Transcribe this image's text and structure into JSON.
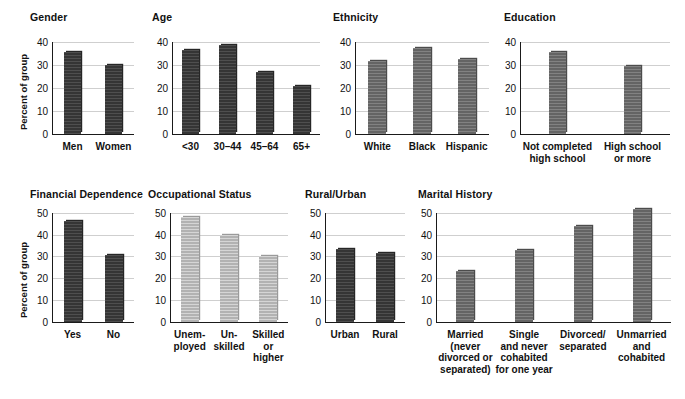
{
  "figure": {
    "y_axis_label": "Percent of group",
    "panels": [
      {
        "id": "gender",
        "title": "Gender",
        "ylim": [
          0,
          40
        ],
        "yticks": [
          0,
          10,
          20,
          30,
          40
        ],
        "shade": "dark",
        "categories": [
          "Men",
          "Women"
        ],
        "values": [
          35.7,
          29.8
        ]
      },
      {
        "id": "age",
        "title": "Age",
        "ylim": [
          0,
          40
        ],
        "yticks": [
          0,
          10,
          20,
          30,
          40
        ],
        "shade": "dark",
        "categories": [
          "<30",
          "30–44",
          "45–64",
          "65+"
        ],
        "values": [
          36.5,
          38.8,
          26.8,
          20.8
        ]
      },
      {
        "id": "ethnicity",
        "title": "Ethnicity",
        "ylim": [
          0,
          40
        ],
        "yticks": [
          0,
          10,
          20,
          30,
          40
        ],
        "shade": "mid",
        "categories": [
          "White",
          "Black",
          "Hispanic"
        ],
        "values": [
          31.5,
          37.4,
          32.5
        ]
      },
      {
        "id": "education",
        "title": "Education",
        "ylim": [
          0,
          40
        ],
        "yticks": [
          0,
          10,
          20,
          30,
          40
        ],
        "shade": "mid",
        "categories": [
          "Not completed\nhigh school",
          "High school\nor more"
        ],
        "values": [
          35.6,
          29.7
        ]
      },
      {
        "id": "financial-dependence",
        "title": "Financial Dependence",
        "ylim": [
          0,
          50
        ],
        "yticks": [
          0,
          10,
          20,
          30,
          40,
          50
        ],
        "shade": "dark",
        "categories": [
          "Yes",
          "No"
        ],
        "values": [
          46.5,
          30.5
        ]
      },
      {
        "id": "occupational-status",
        "title": "Occupational Status",
        "ylim": [
          0,
          50
        ],
        "yticks": [
          0,
          10,
          20,
          30,
          40,
          50
        ],
        "shade": "light",
        "categories": [
          "Unem-\nployed",
          "Un-\nskilled",
          "Skilled\nor\nhigher"
        ],
        "values": [
          48.0,
          39.8,
          30.0
        ]
      },
      {
        "id": "rural-urban",
        "title": "Rural/Urban",
        "ylim": [
          0,
          50
        ],
        "yticks": [
          0,
          10,
          20,
          30,
          40,
          50
        ],
        "shade": "dark",
        "categories": [
          "Urban",
          "Rural"
        ],
        "values": [
          33.6,
          31.6
        ]
      },
      {
        "id": "marital-history",
        "title": "Marital History",
        "ylim": [
          0,
          50
        ],
        "yticks": [
          0,
          10,
          20,
          30,
          40,
          50
        ],
        "shade": "mid",
        "categories": [
          "Married\n(never\ndivorced or\nseparated)",
          "Single\nand never\ncohabited\nfor one year",
          "Divorced/\nseparated",
          "Unmarried\nand\ncohabited"
        ],
        "values": [
          23.5,
          33.0,
          44.0,
          52.0
        ]
      }
    ]
  },
  "chart_data": [
    {
      "type": "bar",
      "title": "Gender",
      "categories": [
        "Men",
        "Women"
      ],
      "values": [
        35.7,
        29.8
      ],
      "xlabel": "",
      "ylabel": "Percent of group",
      "ylim": [
        0,
        40
      ],
      "yticks": [
        0,
        10,
        20,
        30,
        40
      ],
      "grid": "horizontal",
      "legend": "none",
      "bar_color": "#3b3b3b"
    },
    {
      "type": "bar",
      "title": "Age",
      "categories": [
        "<30",
        "30–44",
        "45–64",
        "65+"
      ],
      "values": [
        36.5,
        38.8,
        26.8,
        20.8
      ],
      "xlabel": "",
      "ylabel": "",
      "ylim": [
        0,
        40
      ],
      "yticks": [
        0,
        10,
        20,
        30,
        40
      ],
      "grid": "horizontal",
      "legend": "none",
      "bar_color": "#3b3b3b"
    },
    {
      "type": "bar",
      "title": "Ethnicity",
      "categories": [
        "White",
        "Black",
        "Hispanic"
      ],
      "values": [
        31.5,
        37.4,
        32.5
      ],
      "xlabel": "",
      "ylabel": "",
      "ylim": [
        0,
        40
      ],
      "yticks": [
        0,
        10,
        20,
        30,
        40
      ],
      "grid": "horizontal",
      "legend": "none",
      "bar_color": "#6f6f6f"
    },
    {
      "type": "bar",
      "title": "Education",
      "categories": [
        "Not completed high school",
        "High school or more"
      ],
      "values": [
        35.6,
        29.7
      ],
      "xlabel": "",
      "ylabel": "",
      "ylim": [
        0,
        40
      ],
      "yticks": [
        0,
        10,
        20,
        30,
        40
      ],
      "grid": "horizontal",
      "legend": "none",
      "bar_color": "#6f6f6f"
    },
    {
      "type": "bar",
      "title": "Financial Dependence",
      "categories": [
        "Yes",
        "No"
      ],
      "values": [
        46.5,
        30.5
      ],
      "xlabel": "",
      "ylabel": "Percent of group",
      "ylim": [
        0,
        50
      ],
      "yticks": [
        0,
        10,
        20,
        30,
        40,
        50
      ],
      "grid": "horizontal",
      "legend": "none",
      "bar_color": "#3b3b3b"
    },
    {
      "type": "bar",
      "title": "Occupational Status",
      "categories": [
        "Unemployed",
        "Unskilled",
        "Skilled or higher"
      ],
      "values": [
        48.0,
        39.8,
        30.0
      ],
      "xlabel": "",
      "ylabel": "",
      "ylim": [
        0,
        50
      ],
      "yticks": [
        0,
        10,
        20,
        30,
        40,
        50
      ],
      "grid": "horizontal",
      "legend": "none",
      "bar_color": "#bfbfbf"
    },
    {
      "type": "bar",
      "title": "Rural/Urban",
      "categories": [
        "Urban",
        "Rural"
      ],
      "values": [
        33.6,
        31.6
      ],
      "xlabel": "",
      "ylabel": "",
      "ylim": [
        0,
        50
      ],
      "yticks": [
        0,
        10,
        20,
        30,
        40,
        50
      ],
      "grid": "horizontal",
      "legend": "none",
      "bar_color": "#3b3b3b"
    },
    {
      "type": "bar",
      "title": "Marital History",
      "categories": [
        "Married (never divorced or separated)",
        "Single and never cohabited for one year",
        "Divorced/separated",
        "Unmarried and cohabited"
      ],
      "values": [
        23.5,
        33.0,
        44.0,
        52.0
      ],
      "xlabel": "",
      "ylabel": "",
      "ylim": [
        0,
        50
      ],
      "yticks": [
        0,
        10,
        20,
        30,
        40,
        50
      ],
      "grid": "horizontal",
      "legend": "none",
      "bar_color": "#6f6f6f"
    }
  ]
}
